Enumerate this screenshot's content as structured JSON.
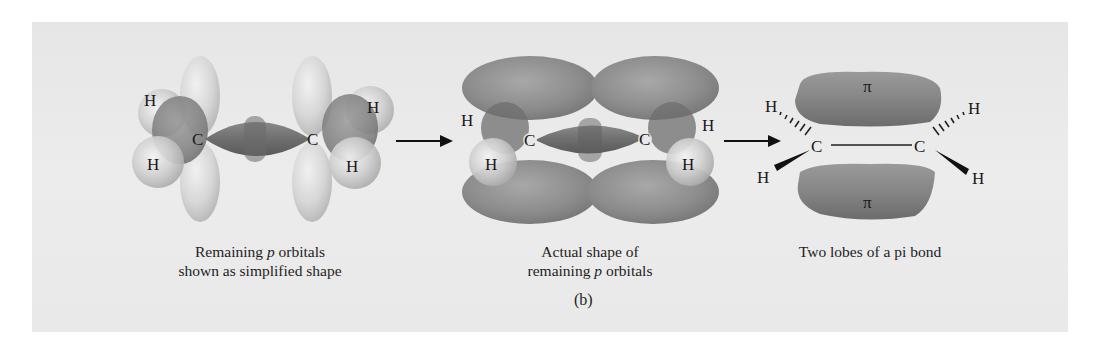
{
  "figure": {
    "label": "(b)",
    "colors": {
      "panel_background": "#e8e8e8",
      "orbital_dark": "#7a7a7a",
      "orbital_light": "#d2d2d2",
      "text": "#1a1a1a"
    },
    "stages": [
      {
        "id": "simplified",
        "caption_line1_pre": "Remaining ",
        "caption_line1_italic": "p",
        "caption_line1_post": " orbitals",
        "caption_line2": "shown as simplified shape",
        "atoms": {
          "h_top_left": "H",
          "h_bottom_left": "H",
          "c_left": "C",
          "c_right": "C",
          "h_top_right": "H",
          "h_bottom_right": "H"
        }
      },
      {
        "id": "actual",
        "caption_line1": "Actual shape of",
        "caption_line2_pre": "remaining ",
        "caption_line2_italic": "p",
        "caption_line2_post": " orbitals",
        "atoms": {
          "h_top_left": "H",
          "h_bottom_left": "H",
          "c_left": "C",
          "c_right": "C",
          "h_top_right": "H",
          "h_bottom_right": "H"
        }
      },
      {
        "id": "pi_bond",
        "caption_line1": "Two lobes of a pi bond",
        "atoms": {
          "h_top_left": "H",
          "h_bottom_left": "H",
          "c_left": "C",
          "c_right": "C",
          "h_top_right": "H",
          "h_bottom_right": "H"
        },
        "lobe_top_label": "π",
        "lobe_bottom_label": "π"
      }
    ],
    "arrows": [
      {
        "from": "simplified",
        "to": "actual"
      },
      {
        "from": "actual",
        "to": "pi_bond"
      }
    ]
  }
}
